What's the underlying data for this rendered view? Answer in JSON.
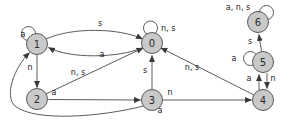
{
  "diagram": {
    "type": "state-machine-diagram",
    "colors": {
      "background": "#ffffff",
      "node_fill": "#c9c9c9",
      "node_stroke": "#595959",
      "edge_stroke": "#4a4a4a",
      "label_text": "#1a1a1a"
    },
    "nodes": [
      {
        "label": "0"
      },
      {
        "label": "1"
      },
      {
        "label": "2"
      },
      {
        "label": "3"
      },
      {
        "label": "4"
      },
      {
        "label": "5"
      },
      {
        "label": "6"
      }
    ],
    "edges": [
      {
        "from": "0",
        "to": "0",
        "label": "n, s"
      },
      {
        "from": "0",
        "to": "1",
        "label": "a"
      },
      {
        "from": "1",
        "to": "1",
        "label": "a"
      },
      {
        "from": "1",
        "to": "0",
        "label": "s"
      },
      {
        "from": "1",
        "to": "2",
        "label": "n"
      },
      {
        "from": "2",
        "to": "0",
        "label": "n, s"
      },
      {
        "from": "2",
        "to": "3",
        "label": "a"
      },
      {
        "from": "3",
        "to": "0",
        "label": "s"
      },
      {
        "from": "3",
        "to": "1",
        "label": "a"
      },
      {
        "from": "3",
        "to": "4",
        "label": "n"
      },
      {
        "from": "4",
        "to": "0",
        "label": "n, s"
      },
      {
        "from": "4",
        "to": "5",
        "label": "a"
      },
      {
        "from": "5",
        "to": "4",
        "label": "n"
      },
      {
        "from": "5",
        "to": "5",
        "label": "a"
      },
      {
        "from": "5",
        "to": "6",
        "label": "s"
      },
      {
        "from": "6",
        "to": "6",
        "label": "a, n, s"
      }
    ]
  }
}
